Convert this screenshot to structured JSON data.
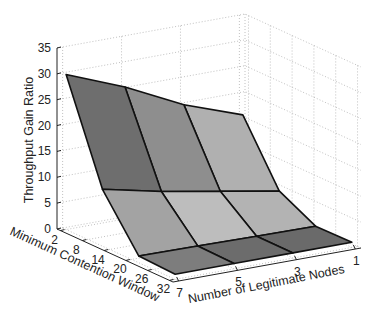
{
  "chart_data": {
    "type": "surface3d",
    "title": "",
    "xlabel": "Minimum Contention Window",
    "ylabel": "Number of Legitimate Nodes",
    "zlabel": "Throughput Gain Ratio",
    "x_ticks": [
      "2",
      "8",
      "14",
      "20",
      "26",
      "32"
    ],
    "y_ticks": [
      "7",
      "5",
      "3",
      "1"
    ],
    "z_ticks": [
      "0",
      "5",
      "10",
      "15",
      "20",
      "25",
      "30",
      "35"
    ],
    "zlim": [
      0,
      35
    ],
    "grid": true,
    "x": [
      2,
      12,
      22,
      32
    ],
    "y": [
      7,
      5,
      3,
      1
    ],
    "z": [
      [
        30.0,
        25.5,
        20.0,
        16.0
      ],
      [
        11.0,
        8.5,
        6.5,
        4.5
      ],
      [
        1.3,
        1.2,
        1.0,
        0.9
      ],
      [
        1.0,
        1.0,
        1.0,
        1.0
      ]
    ],
    "colormap": "gray"
  }
}
